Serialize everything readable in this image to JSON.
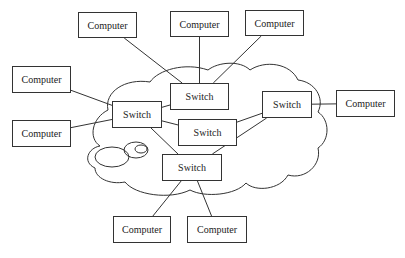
{
  "diagram": {
    "type": "network-topology",
    "cloud_label": "",
    "nodes": {
      "computer_top_left": {
        "label": "Computer",
        "x": 78,
        "y": 12,
        "w": 59,
        "h": 26
      },
      "computer_top_mid": {
        "label": "Computer",
        "x": 170,
        "y": 11,
        "w": 59,
        "h": 26
      },
      "computer_top_right": {
        "label": "Computer",
        "x": 245,
        "y": 10,
        "w": 59,
        "h": 26
      },
      "computer_left_1": {
        "label": "Computer",
        "x": 12,
        "y": 66,
        "w": 59,
        "h": 27
      },
      "computer_left_2": {
        "label": "Computer",
        "x": 12,
        "y": 120,
        "w": 59,
        "h": 27
      },
      "computer_right": {
        "label": "Computer",
        "x": 336,
        "y": 90,
        "w": 59,
        "h": 27
      },
      "computer_bottom_left": {
        "label": "Computer",
        "x": 113,
        "y": 216,
        "w": 58,
        "h": 27
      },
      "computer_bottom_right": {
        "label": "Computer",
        "x": 187,
        "y": 216,
        "w": 60,
        "h": 27
      },
      "switch_top": {
        "label": "Switch",
        "x": 170,
        "y": 83,
        "w": 59,
        "h": 27
      },
      "switch_left": {
        "label": "Switch",
        "x": 112,
        "y": 101,
        "w": 50,
        "h": 27
      },
      "switch_center": {
        "label": "Switch",
        "x": 178,
        "y": 119,
        "w": 59,
        "h": 27
      },
      "switch_right": {
        "label": "Switch",
        "x": 262,
        "y": 91,
        "w": 50,
        "h": 27
      },
      "switch_bottom": {
        "label": "Switch",
        "x": 162,
        "y": 154,
        "w": 60,
        "h": 27
      }
    },
    "edges": [
      [
        "computer_top_left",
        "switch_top"
      ],
      [
        "computer_top_mid",
        "switch_top"
      ],
      [
        "computer_top_right",
        "switch_top"
      ],
      [
        "computer_left_1",
        "switch_left"
      ],
      [
        "computer_left_2",
        "switch_left"
      ],
      [
        "switch_left",
        "switch_top"
      ],
      [
        "switch_left",
        "switch_center"
      ],
      [
        "switch_left",
        "switch_bottom"
      ],
      [
        "switch_center",
        "switch_right"
      ],
      [
        "switch_bottom",
        "switch_right"
      ],
      [
        "switch_right",
        "computer_right"
      ],
      [
        "switch_bottom",
        "computer_bottom_left"
      ],
      [
        "switch_bottom",
        "computer_bottom_right"
      ]
    ],
    "colors": {
      "line": "#333333",
      "box_border": "#333333",
      "background": "#ffffff"
    }
  }
}
